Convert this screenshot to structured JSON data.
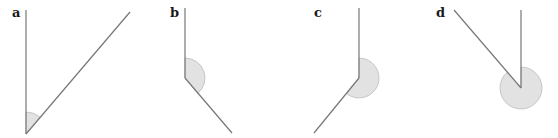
{
  "figure": {
    "panels": [
      {
        "label": "a",
        "angle_type": "acute",
        "vertex": [
          26,
          134
        ],
        "ray1_end": [
          26,
          10
        ],
        "ray2_end": [
          130,
          12
        ],
        "arc_radius": 22
      },
      {
        "label": "b",
        "angle_type": "obtuse",
        "vertex": [
          185,
          78
        ],
        "ray1_end": [
          185,
          8
        ],
        "ray2_end": [
          232,
          133
        ],
        "arc_radius": 20
      },
      {
        "label": "c",
        "angle_type": "reflex-over-180",
        "vertex": [
          359,
          78
        ],
        "ray1_end": [
          359,
          8
        ],
        "ray2_end": [
          314,
          133
        ],
        "arc_radius": 20
      },
      {
        "label": "d",
        "angle_type": "reflex-near-360",
        "vertex": [
          521,
          88
        ],
        "ray1_end": [
          521,
          10
        ],
        "ray2_end": [
          454,
          10
        ],
        "arc_radius": 21
      }
    ],
    "colors": {
      "line": "#777777",
      "arc_fill": "#e2e2e2",
      "arc_stroke": "#bdbdbd",
      "label": "#1a1a1a"
    }
  }
}
